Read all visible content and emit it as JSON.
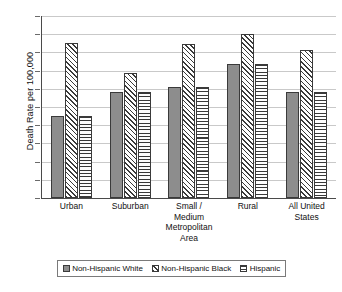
{
  "chart_data": {
    "type": "bar",
    "title": "",
    "subtitle": "",
    "xlabel": "",
    "ylabel": "Death Rate per 100,000",
    "ylim": [
      0,
      200
    ],
    "yticks": [
      0,
      20,
      40,
      60,
      80,
      100,
      120,
      140,
      160,
      180,
      200
    ],
    "ytick_labels": [
      "0",
      "20",
      "40",
      "60",
      "80",
      "100",
      "120",
      "140",
      "160",
      "180",
      "200"
    ],
    "grid": true,
    "legend_position": "bottom",
    "categories": [
      "Urban",
      "Suburban",
      "Small /\nMedium\nMetropolitan\nArea",
      "Rural",
      "All United\nStates"
    ],
    "series": [
      {
        "name": "Non-Hispanic White",
        "pattern": "solid",
        "color": "#8d8d8d",
        "values": [
          90,
          117,
          122,
          147,
          117
        ]
      },
      {
        "name": "Non-Hispanic Black",
        "pattern": "diagonal",
        "color": "#ffffff",
        "values": [
          170,
          137,
          169,
          180,
          163
        ]
      },
      {
        "name": "Hispanic",
        "pattern": "horizontal",
        "color": "#ffffff",
        "values": [
          90,
          117,
          122,
          147,
          117
        ]
      }
    ]
  },
  "legend": {
    "items": [
      {
        "label": "Non-Hispanic White",
        "pattern": "solid"
      },
      {
        "label": "Non-Hispanic Black",
        "pattern": "diagonal"
      },
      {
        "label": "Hispanic",
        "pattern": "horizontal"
      }
    ]
  },
  "colors": {
    "background": "#ffffff",
    "axis": "#4a4a4a",
    "gridline": "#c9c9c9",
    "bar_outline": "#3a3a3a",
    "bar_solid_fill": "#8d8d8d",
    "text": "#111111",
    "legend_border": "#7a7a7a"
  }
}
